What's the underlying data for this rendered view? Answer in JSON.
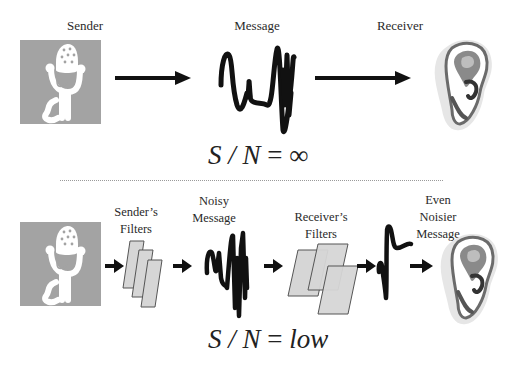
{
  "top_row": {
    "labels": {
      "sender": "Sender",
      "message": "Message",
      "receiver": "Receiver"
    },
    "formula": {
      "lhs": "S / N",
      "equals": "=",
      "rhs": "∞"
    }
  },
  "bottom_row": {
    "labels": {
      "senders_filters_line1": "Sender’s",
      "senders_filters_line2": "Filters",
      "noisy_message_line1": "Noisy",
      "noisy_message_line2": "Message",
      "receivers_filters_line1": "Receiver’s",
      "receivers_filters_line2": "Filters",
      "even_noisier_line1": "Even",
      "even_noisier_line2": "Noisier",
      "even_noisier_line3": "Message"
    },
    "formula": {
      "lhs": "S / N",
      "equals": "=",
      "rhs": "low"
    }
  },
  "icons": {
    "sender": "microphone-icon",
    "receiver": "ear-icon",
    "filter": "filter-sheet-icon",
    "arrow": "right-arrow-icon",
    "signal": "waveform-icon"
  },
  "colors": {
    "icon_box": "#a3a3a3",
    "filter_fill": "#d6d6d6",
    "filter_stroke": "#555555",
    "waveform": "#111111",
    "divider": "#9a9a9a"
  }
}
